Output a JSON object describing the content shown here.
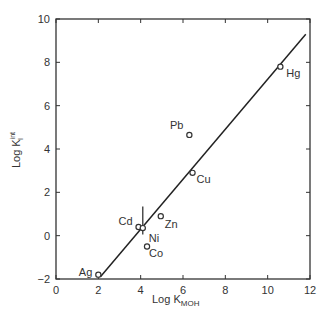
{
  "chart_data": {
    "type": "scatter",
    "title": "",
    "xlabel": "Log K_MOH",
    "ylabel": "Log K_I^int",
    "xlim": [
      0,
      12
    ],
    "ylim": [
      -2,
      10
    ],
    "xticks": [
      0,
      2,
      4,
      6,
      8,
      10,
      12
    ],
    "yticks": [
      -2,
      0,
      2,
      4,
      6,
      8,
      10
    ],
    "grid": false,
    "points": [
      {
        "label": "Ag",
        "x": 2.0,
        "y": -1.8
      },
      {
        "label": "Cd",
        "x": 3.9,
        "y": 0.4
      },
      {
        "label": "Ni",
        "x": 4.1,
        "y": 0.35,
        "error_y": [
          -0.3,
          1.0
        ]
      },
      {
        "label": "Co",
        "x": 4.3,
        "y": -0.5
      },
      {
        "label": "Zn",
        "x": 4.95,
        "y": 0.9
      },
      {
        "label": "Pb",
        "x": 6.3,
        "y": 4.65
      },
      {
        "label": "Cu",
        "x": 6.45,
        "y": 2.9
      },
      {
        "label": "Hg",
        "x": 10.6,
        "y": 7.8
      }
    ],
    "fit_line": {
      "x": [
        2.1,
        11.8
      ],
      "y": [
        -1.9,
        9.3
      ]
    }
  },
  "labels": {
    "xlabel_main": "Log K",
    "xlabel_sub": "MOH",
    "ylabel_main": "Log K",
    "ylabel_sup": "int",
    "ylabel_sub": "I"
  }
}
